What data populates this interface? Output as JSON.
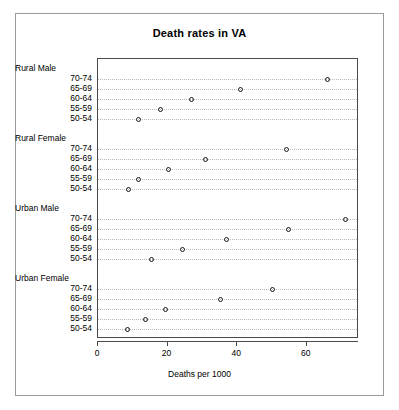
{
  "chart_data": {
    "type": "scatter",
    "plot_style": "dotchart",
    "title": "Death rates in VA",
    "xlabel": "Deaths per 1000",
    "ylabel": "",
    "xlim": [
      0,
      75
    ],
    "xticks": [
      0,
      20,
      40,
      60
    ],
    "xtick_labels": [
      "0",
      "20",
      "40",
      "60"
    ],
    "grid": "horizontal-dotted",
    "legend": "none",
    "marker": "open-circle",
    "groups": [
      {
        "name": "Rural Male",
        "categories": [
          "50-54",
          "55-59",
          "60-64",
          "65-69",
          "70-74"
        ],
        "values": [
          11.7,
          18.1,
          26.9,
          41.0,
          66.0
        ]
      },
      {
        "name": "Rural Female",
        "categories": [
          "50-54",
          "55-59",
          "60-64",
          "65-69",
          "70-74"
        ],
        "values": [
          8.7,
          11.7,
          20.3,
          30.9,
          54.3
        ]
      },
      {
        "name": "Urban Male",
        "categories": [
          "50-54",
          "55-59",
          "60-64",
          "65-69",
          "70-74"
        ],
        "values": [
          15.4,
          24.3,
          37.0,
          54.6,
          71.1
        ]
      },
      {
        "name": "Urban Female",
        "categories": [
          "50-54",
          "55-59",
          "60-64",
          "65-69",
          "70-74"
        ],
        "values": [
          8.4,
          13.6,
          19.3,
          35.1,
          50.0
        ]
      }
    ]
  },
  "colors": {
    "marker_stroke": "#1a1a1a",
    "grid": "#b9b9b9",
    "panel_border": "#4a4a4a",
    "frame_border": "#9a9a9a",
    "background": "#ffffff",
    "text": "#000000"
  }
}
